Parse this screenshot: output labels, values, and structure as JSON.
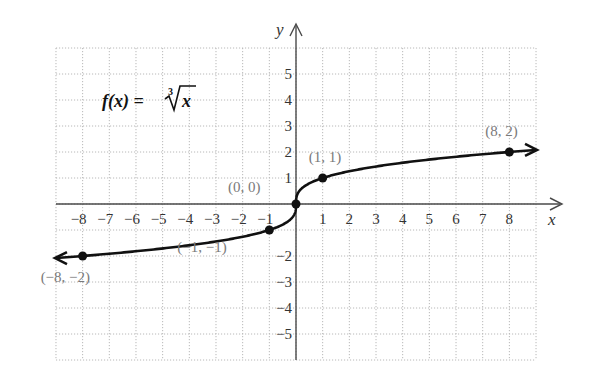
{
  "chart_data": {
    "type": "line",
    "title_parts": {
      "lhs": "f(x) = ",
      "index": "3",
      "radicand": "x"
    },
    "xlabel": "x",
    "ylabel": "y",
    "xlim": [
      -9,
      9
    ],
    "ylim": [
      -6,
      6
    ],
    "grid": true,
    "grid_style": "dotted",
    "x_ticks": [
      -8,
      -7,
      -6,
      -5,
      -4,
      -3,
      -2,
      -1,
      1,
      2,
      3,
      4,
      5,
      6,
      7,
      8
    ],
    "x_tick_labels": [
      "−8",
      "−7",
      "−6",
      "−5",
      "−4",
      "−3",
      "−2",
      "−1",
      "1",
      "2",
      "3",
      "4",
      "5",
      "6",
      "7",
      "8"
    ],
    "y_ticks": [
      5,
      4,
      3,
      2,
      1,
      -2,
      -3,
      -4,
      -5
    ],
    "y_tick_labels": [
      "5",
      "4",
      "3",
      "2",
      "1",
      "−2",
      "−3",
      "−4",
      "−5"
    ],
    "series": [
      {
        "name": "f(x) = cube root of x",
        "function": "cbrt",
        "domain": [
          -9,
          9
        ],
        "arrows_at_ends": true,
        "color": "#111111"
      }
    ],
    "points": [
      {
        "x": -8,
        "y": -2,
        "label": "(−8, −2)"
      },
      {
        "x": -1,
        "y": -1,
        "label": "(−1, −1)"
      },
      {
        "x": 0,
        "y": 0,
        "label": "(0, 0)"
      },
      {
        "x": 1,
        "y": 1,
        "label": "(1, 1)"
      },
      {
        "x": 8,
        "y": 2,
        "label": "(8, 2)"
      }
    ]
  },
  "colors": {
    "curve": "#111111",
    "axis": "#4a4a4a",
    "grid": "#b8b8b8",
    "point_label": "#7a7a7a"
  }
}
